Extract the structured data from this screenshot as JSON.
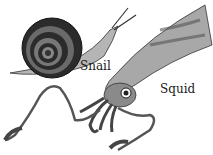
{
  "illustration": {
    "subjects": [
      {
        "name": "snail",
        "label": "Snail"
      },
      {
        "name": "squid",
        "label": "Squid"
      }
    ]
  },
  "colors": {
    "background": "#ffffff",
    "ink": "#1a1a1a",
    "shell_dark": "#2b2b2b",
    "body_gray": "#8a8a8a",
    "light_gray": "#c8c8c8"
  }
}
